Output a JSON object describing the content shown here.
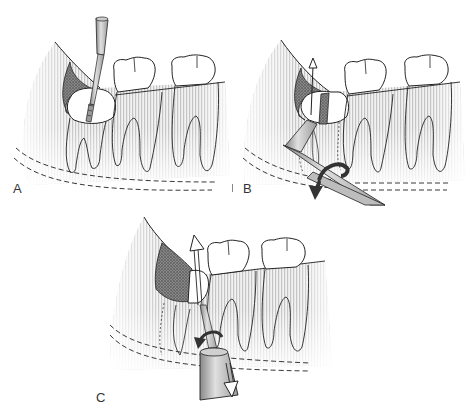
{
  "figure": {
    "colors": {
      "outline": "#222222",
      "bone_stripe": "#c8c8c8",
      "bone_fade": "#f4f4f4",
      "stipple_dark": "#555555",
      "instrument_fill": "#bdbdbd",
      "instrument_dark": "#7a7a7a",
      "arrow_dark": "#333333",
      "background": "#ffffff"
    },
    "panels": [
      {
        "id": "A",
        "label": "A",
        "step": "Bur sectioning the crown of the impacted molar",
        "instrument": "surgical-handpiece-bur",
        "arrows": []
      },
      {
        "id": "B",
        "label": "B",
        "step": "Elevator inserted and rotated to separate crown segment",
        "instrument": "straight-elevator",
        "arrows": [
          "up-arrow-open",
          "rotation-arrow-dark"
        ]
      },
      {
        "id": "C",
        "label": "C",
        "step": "Elevation of remaining root segment",
        "instrument": "elevator-handle",
        "arrows": [
          "up-arrow-open",
          "rotation-arrow-dark",
          "down-arrow-open"
        ]
      }
    ]
  }
}
